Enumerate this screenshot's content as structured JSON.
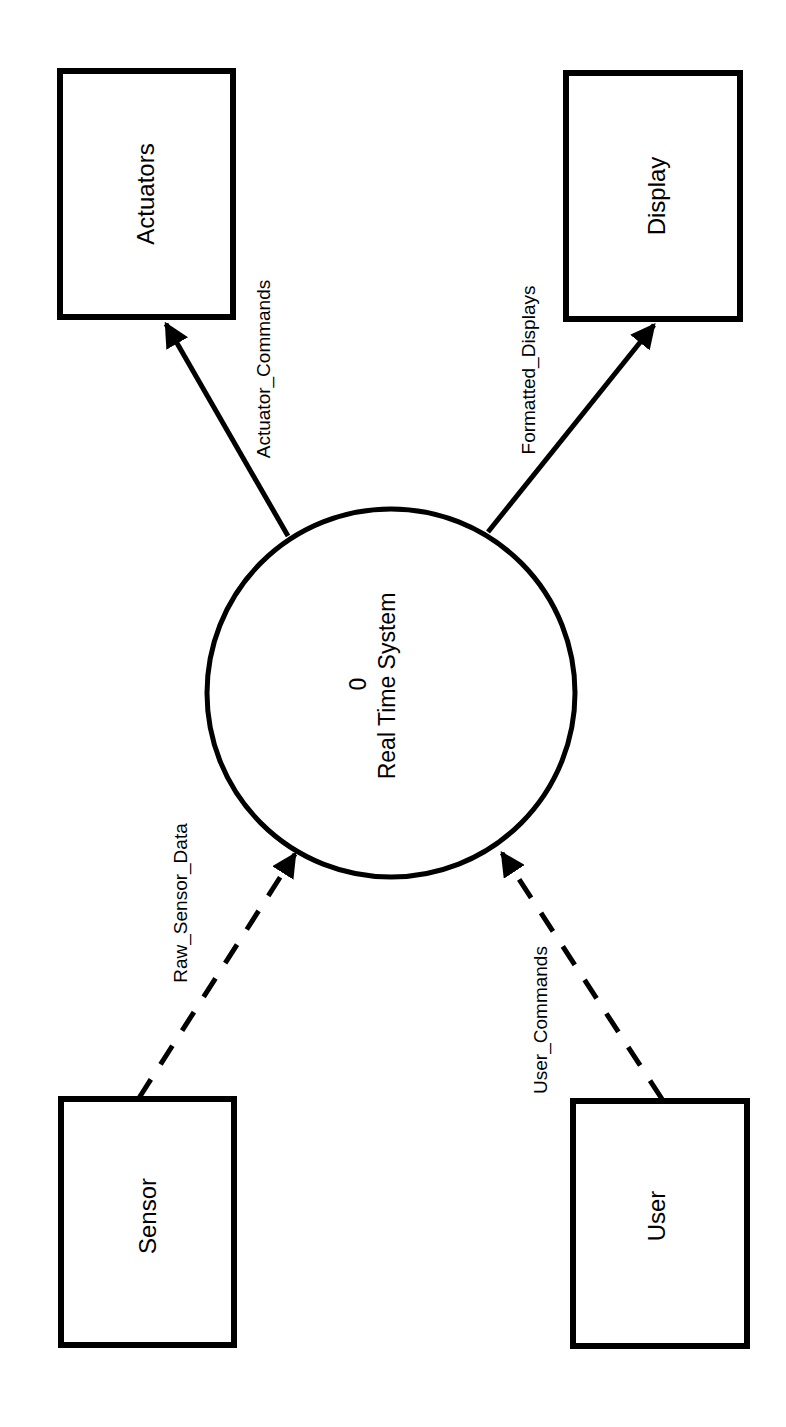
{
  "diagram": {
    "type": "context data flow diagram",
    "orientation": "rotated -90deg",
    "colors": {
      "stroke": "#000000",
      "background": "#ffffff"
    },
    "process": {
      "number": "0",
      "name": "Real Time System"
    },
    "entities": [
      {
        "id": "actuators",
        "label": "Actuators"
      },
      {
        "id": "display",
        "label": "Display"
      },
      {
        "id": "sensor",
        "label": "Sensor"
      },
      {
        "id": "user",
        "label": "User"
      }
    ],
    "flows": [
      {
        "id": "actuator_commands",
        "label": "Actuator_Commands",
        "from": "Real Time System",
        "to": "Actuators",
        "style": "solid"
      },
      {
        "id": "formatted_displays",
        "label": "Formatted_Displays",
        "from": "Real Time System",
        "to": "Display",
        "style": "solid"
      },
      {
        "id": "raw_sensor_data",
        "label": "Raw_Sensor_Data",
        "from": "Sensor",
        "to": "Real Time System",
        "style": "dashed"
      },
      {
        "id": "user_commands",
        "label": "User_Commands",
        "from": "User",
        "to": "Real Time System",
        "style": "dashed"
      }
    ]
  }
}
